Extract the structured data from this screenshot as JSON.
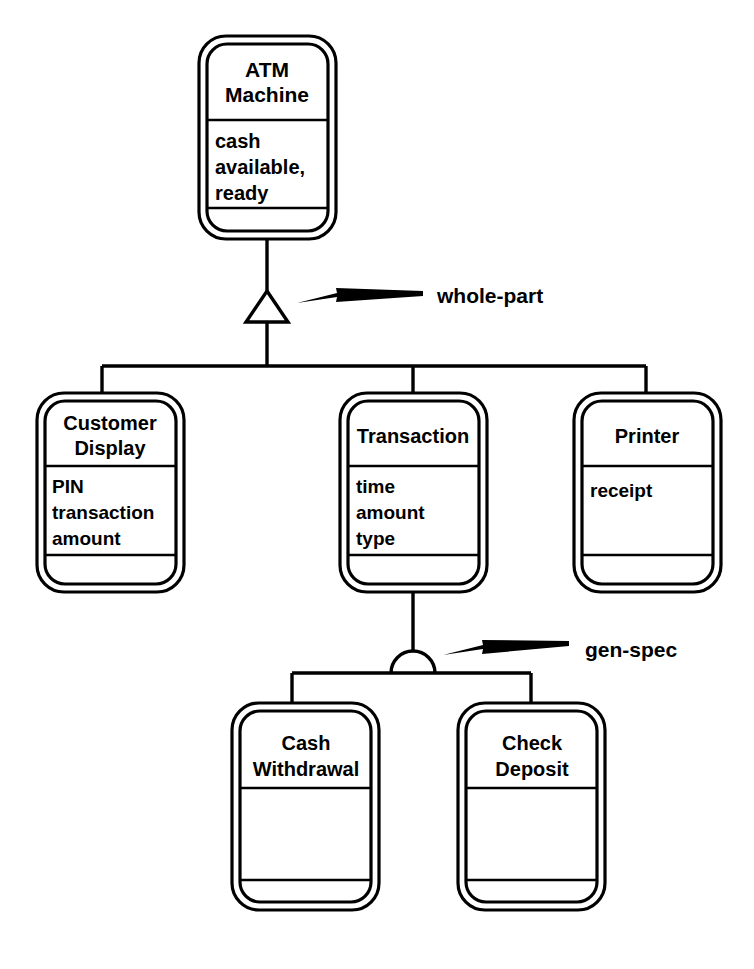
{
  "diagram": {
    "notation": "Coad-Yourdon OOA class-&-object diagram",
    "background_color": "#ffffff",
    "line_color": "#000000",
    "classes": [
      {
        "id": "atm-machine",
        "name_lines": [
          "ATM",
          "Machine"
        ],
        "attributes": [
          "cash",
          "available,",
          "ready"
        ],
        "services": []
      },
      {
        "id": "customer-display",
        "name_lines": [
          "Customer",
          "Display"
        ],
        "attributes": [
          "PIN",
          "transaction",
          "amount"
        ],
        "services": []
      },
      {
        "id": "transaction",
        "name_lines": [
          "Transaction"
        ],
        "attributes": [
          "time",
          "amount",
          "type"
        ],
        "services": []
      },
      {
        "id": "printer",
        "name_lines": [
          "Printer"
        ],
        "attributes": [
          "receipt"
        ],
        "services": []
      },
      {
        "id": "cash-withdrawal",
        "name_lines": [
          "Cash",
          "Withdrawal"
        ],
        "attributes": [],
        "services": []
      },
      {
        "id": "check-deposit",
        "name_lines": [
          "Check",
          "Deposit"
        ],
        "attributes": [],
        "services": []
      }
    ],
    "annotations": [
      {
        "id": "whole-part",
        "label": "whole-part",
        "symbol": "hollow-triangle",
        "points_to": "atm-machine"
      },
      {
        "id": "gen-spec",
        "label": "gen-spec",
        "symbol": "semicircle",
        "points_to": "transaction"
      }
    ],
    "relationships": [
      {
        "type": "whole-part",
        "whole": "atm-machine",
        "parts": [
          "customer-display",
          "transaction",
          "printer"
        ]
      },
      {
        "type": "gen-spec",
        "general": "transaction",
        "specials": [
          "cash-withdrawal",
          "check-deposit"
        ]
      }
    ]
  }
}
